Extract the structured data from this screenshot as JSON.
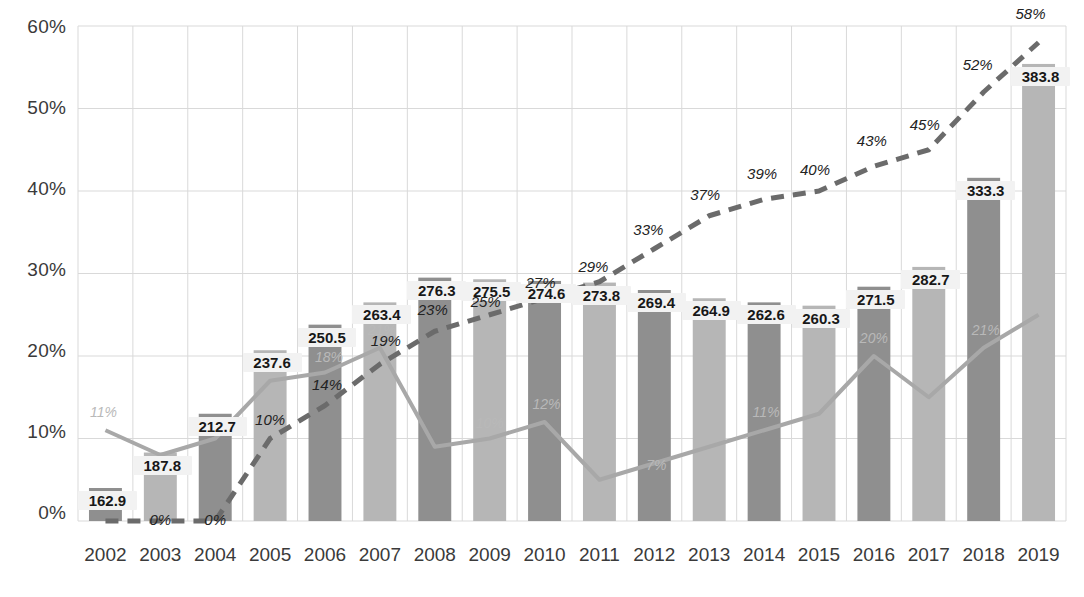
{
  "chart_data": {
    "type": "bar",
    "title": "",
    "subtitle": "",
    "xlabel": "",
    "ylabel": "",
    "ylim": [
      0,
      60
    ],
    "ytick_labels": [
      "0%",
      "10%",
      "20%",
      "30%",
      "40%",
      "50%",
      "60%"
    ],
    "ytick_values": [
      0,
      10,
      20,
      30,
      40,
      50,
      60
    ],
    "grid": true,
    "legend_position": "none",
    "categories": [
      "2002",
      "2003",
      "2004",
      "2005",
      "2006",
      "2007",
      "2008",
      "2009",
      "2010",
      "2011",
      "2012",
      "2013",
      "2014",
      "2015",
      "2016",
      "2017",
      "2018",
      "2019"
    ],
    "series": [
      {
        "name": "bars",
        "kind": "bar",
        "value_labels": [
          "162.9",
          "187.8",
          "212.7",
          "237.6",
          "250.5",
          "263.4",
          "276.3",
          "275.5",
          "274.6",
          "273.8",
          "269.4",
          "264.9",
          "262.6",
          "260.3",
          "271.5",
          "282.7",
          "333.3",
          "383.8"
        ],
        "values": [
          162.9,
          187.8,
          212.7,
          237.6,
          250.5,
          263.4,
          276.3,
          275.5,
          274.6,
          273.8,
          269.4,
          264.9,
          262.6,
          260.3,
          271.5,
          282.7,
          333.3,
          383.8
        ],
        "bar_pct_heights": [
          4.0,
          8.3,
          13.0,
          20.7,
          23.8,
          26.5,
          29.5,
          29.3,
          29.1,
          28.9,
          28.0,
          27.0,
          26.5,
          26.1,
          28.4,
          30.8,
          41.6,
          55.4
        ],
        "colors_alternating": [
          "#8f8f8f",
          "#b6b6b6"
        ]
      },
      {
        "name": "dashed-line",
        "kind": "line",
        "style": "dashed",
        "color": "#6b6b6b",
        "labels": [
          "0%",
          "0%",
          "0%",
          "10%",
          "14%",
          "19%",
          "23%",
          "25%",
          "27%",
          "29%",
          "33%",
          "37%",
          "39%",
          "40%",
          "43%",
          "45%",
          "52%",
          "58%"
        ],
        "values": [
          0,
          0,
          0,
          10,
          14,
          19,
          23,
          25,
          27,
          29,
          33,
          37,
          39,
          40,
          43,
          45,
          52,
          58
        ]
      },
      {
        "name": "solid-line",
        "kind": "line",
        "style": "solid",
        "color": "#a8a8a8",
        "labels": [
          "11%",
          "8%",
          "10%",
          "17%",
          "18%",
          "21%",
          "9%",
          "10%",
          "12%",
          "5%",
          "7%",
          "9%",
          "11%",
          "13%",
          "20%",
          "15%",
          "21%",
          "25%"
        ],
        "values": [
          11,
          8,
          10,
          17,
          18,
          21,
          9,
          10,
          12,
          5,
          7,
          9,
          11,
          13,
          20,
          15,
          21,
          25
        ]
      }
    ],
    "visible_dash_labels": [
      "",
      "0%",
      "0%",
      "10%",
      "14%",
      "19%",
      "23%",
      "25%",
      "27%",
      "29%",
      "33%",
      "37%",
      "39%",
      "40%",
      "43%",
      "45%",
      "52%",
      "58%"
    ],
    "visible_solid_labels": [
      "11%",
      "",
      "",
      "",
      "18%",
      "21%",
      "",
      "10%",
      "12%",
      "",
      "7%",
      "",
      "11%",
      "",
      "20%",
      "",
      "21%",
      ""
    ],
    "colors": {
      "bar_dark": "#8f8f8f",
      "bar_light": "#b6b6b6",
      "dashed_line": "#6b6b6b",
      "solid_line": "#a8a8a8",
      "grid": "#d9d9d9",
      "axis_text": "#3a3a3a",
      "background": "#ffffff"
    }
  },
  "axis": {
    "y_ticks": [
      "60%",
      "50%",
      "40%",
      "30%",
      "20%",
      "10%",
      "0%"
    ],
    "x_ticks": [
      "2002",
      "2003",
      "2004",
      "2005",
      "2006",
      "2007",
      "2008",
      "2009",
      "2010",
      "2011",
      "2012",
      "2013",
      "2014",
      "2015",
      "2016",
      "2017",
      "2018",
      "2019"
    ]
  }
}
